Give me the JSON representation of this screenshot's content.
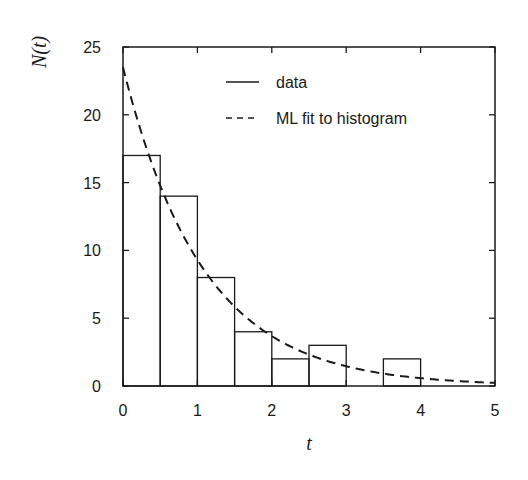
{
  "chart_data": {
    "type": "bar",
    "title": "",
    "xlabel": "t",
    "ylabel": "N(t)",
    "xlim": [
      0,
      5
    ],
    "ylim": [
      0,
      25
    ],
    "xticks": [
      0,
      1,
      2,
      3,
      4,
      5
    ],
    "yticks": [
      0,
      5,
      10,
      15,
      20,
      25
    ],
    "grid": false,
    "legend_position": "upper right",
    "series": [
      {
        "name": "data",
        "type": "step-histogram",
        "style": "solid",
        "bin_edges": [
          0,
          0.5,
          1,
          1.5,
          2,
          2.5,
          3,
          3.5,
          4,
          4.5,
          5
        ],
        "values": [
          17,
          14,
          8,
          4,
          2,
          3,
          0,
          2,
          0,
          0
        ]
      },
      {
        "name": "ML fit to histogram",
        "type": "line",
        "style": "dashed",
        "function": "N(t) = 23.5 * exp(-0.93 t)",
        "x": [
          0,
          0.5,
          1,
          1.5,
          2,
          2.5,
          3,
          3.5,
          4,
          4.5,
          5
        ],
        "values": [
          23.5,
          14.8,
          9.3,
          5.8,
          3.7,
          2.3,
          1.4,
          0.9,
          0.6,
          0.4,
          0.2
        ]
      }
    ]
  },
  "legend": {
    "items": [
      {
        "label": "data",
        "style": "solid"
      },
      {
        "label": "ML fit to histogram",
        "style": "dashed"
      }
    ]
  },
  "axes": {
    "xlabel": "t",
    "ylabel": "N(t)"
  },
  "colors": {
    "ink": "#1a1a1a",
    "background": "#ffffff"
  }
}
